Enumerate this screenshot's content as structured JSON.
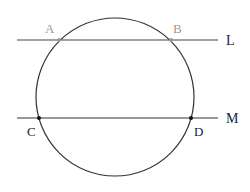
{
  "diagram": {
    "circle": {
      "cx": 115,
      "cy": 97,
      "r": 79,
      "stroke": "#333333"
    },
    "lines": [
      {
        "name": "L",
        "label": "L",
        "y": 40,
        "x1": 17,
        "x2": 218,
        "color": "#444444",
        "label_color": "#222222"
      },
      {
        "name": "M",
        "label": "M",
        "y": 118,
        "x1": 17,
        "x2": 218,
        "color": "#333333",
        "label_color": "#222222"
      }
    ],
    "points": [
      {
        "label": "A",
        "x": 59,
        "y": 40,
        "color": "#999999",
        "label_color": "#999999"
      },
      {
        "label": "B",
        "x": 171,
        "y": 40,
        "color": "#999999",
        "label_color": "#999999"
      },
      {
        "label": "C",
        "x": 39,
        "y": 118,
        "color": "#111111",
        "label_color": "#222222"
      },
      {
        "label": "D",
        "x": 191,
        "y": 118,
        "color": "#111111",
        "label_color": "#222222"
      }
    ]
  },
  "labels": {
    "A": "A",
    "B": "B",
    "C": "C",
    "D": "D",
    "L": "L",
    "M": "M"
  }
}
